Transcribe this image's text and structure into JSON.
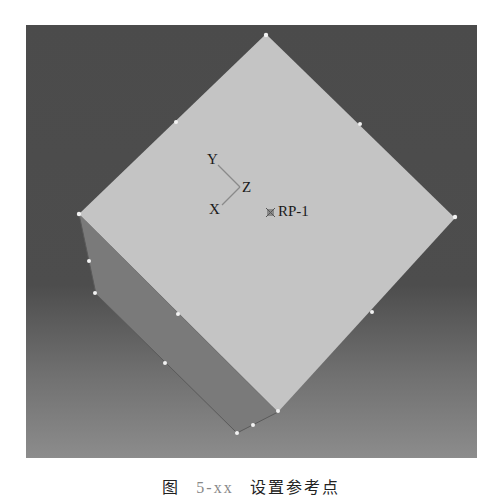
{
  "viewport": {
    "background_top": "#4b4b4b",
    "background_bottom": "#8c8c8c",
    "top_face_color": "#c4c4c4",
    "side_face_color": "#7a7a7a"
  },
  "triad": {
    "x_label": "X",
    "y_label": "Y",
    "z_label": "Z"
  },
  "reference_point": {
    "icon": "reference-point-icon",
    "label": "RP-1"
  },
  "caption": {
    "prefix": "图",
    "number": "5-xx",
    "title": "设置参考点"
  }
}
